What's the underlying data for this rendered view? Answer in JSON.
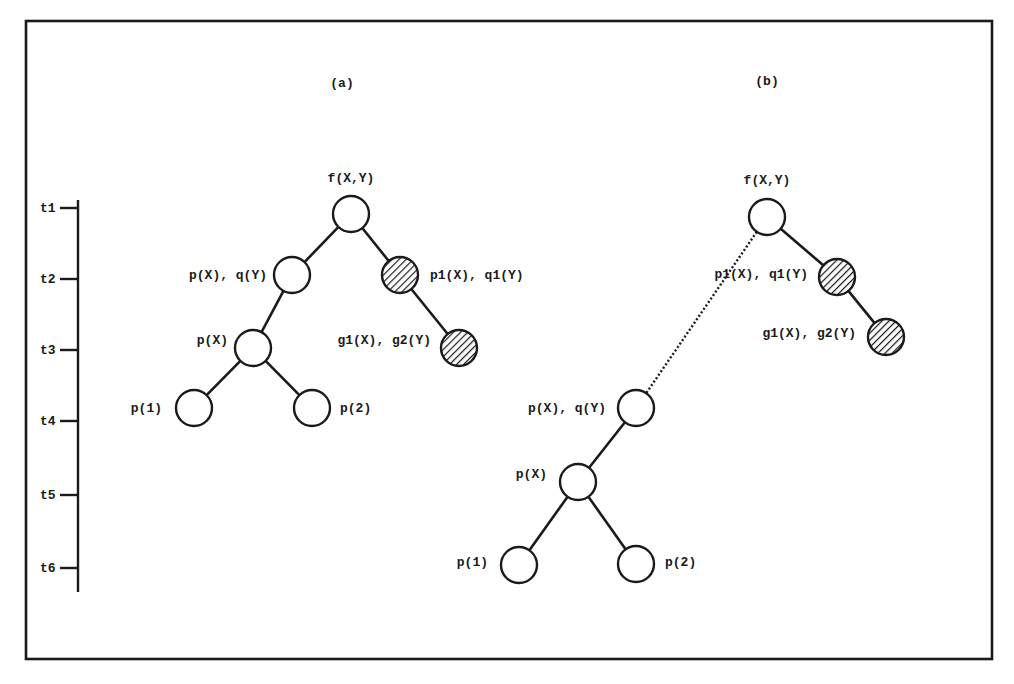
{
  "figure": {
    "panels": [
      {
        "id": "a",
        "title": "(a)",
        "nodes": [
          {
            "id": "root",
            "label": "f(X,Y)",
            "time": "t1",
            "hatched": false
          },
          {
            "id": "pq",
            "label": "p(X), q(Y)",
            "time": "t2",
            "hatched": false
          },
          {
            "id": "p1q1",
            "label": "p1(X), q1(Y)",
            "time": "t2",
            "hatched": true
          },
          {
            "id": "px",
            "label": "p(X)",
            "time": "t3",
            "hatched": false
          },
          {
            "id": "g1g2",
            "label": "g1(X), g2(Y)",
            "time": "t3",
            "hatched": true
          },
          {
            "id": "p1",
            "label": "p(1)",
            "time": "t4",
            "hatched": false
          },
          {
            "id": "p2",
            "label": "p(2)",
            "time": "t4",
            "hatched": false
          }
        ],
        "edges": [
          {
            "from": "root",
            "to": "pq",
            "style": "solid"
          },
          {
            "from": "root",
            "to": "p1q1",
            "style": "solid"
          },
          {
            "from": "pq",
            "to": "px",
            "style": "solid"
          },
          {
            "from": "p1q1",
            "to": "g1g2",
            "style": "solid"
          },
          {
            "from": "px",
            "to": "p1",
            "style": "solid"
          },
          {
            "from": "px",
            "to": "p2",
            "style": "solid"
          }
        ]
      },
      {
        "id": "b",
        "title": "(b)",
        "nodes": [
          {
            "id": "root",
            "label": "f(X,Y)",
            "time": "t1",
            "hatched": false
          },
          {
            "id": "p1q1",
            "label": "p1(X), q1(Y)",
            "time": "t2",
            "hatched": true
          },
          {
            "id": "g1g2",
            "label": "g1(X), g2(Y)",
            "time": "t3",
            "hatched": true
          },
          {
            "id": "pq",
            "label": "p(X), q(Y)",
            "time": "t4",
            "hatched": false
          },
          {
            "id": "px",
            "label": "p(X)",
            "time": "t5",
            "hatched": false
          },
          {
            "id": "p1",
            "label": "p(1)",
            "time": "t6",
            "hatched": false
          },
          {
            "id": "p2",
            "label": "p(2)",
            "time": "t6",
            "hatched": false
          }
        ],
        "edges": [
          {
            "from": "root",
            "to": "p1q1",
            "style": "solid"
          },
          {
            "from": "p1q1",
            "to": "g1g2",
            "style": "solid"
          },
          {
            "from": "root",
            "to": "pq",
            "style": "dotted"
          },
          {
            "from": "pq",
            "to": "px",
            "style": "solid"
          },
          {
            "from": "px",
            "to": "p1",
            "style": "solid"
          },
          {
            "from": "px",
            "to": "p2",
            "style": "solid"
          }
        ]
      }
    ],
    "timeline": {
      "ticks": [
        "t1",
        "t2",
        "t3",
        "t4",
        "t5",
        "t6"
      ]
    },
    "colors": {
      "ink": "#1a1a1a",
      "background": "#ffffff"
    }
  }
}
